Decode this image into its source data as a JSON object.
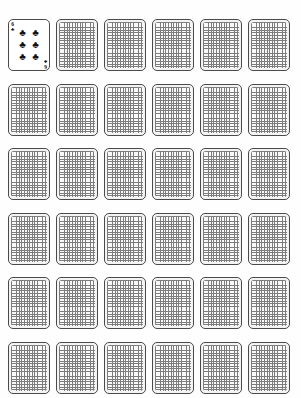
{
  "board": {
    "title": "Playing Card Grid",
    "columns": 6,
    "rows": 6,
    "total_cards": 36,
    "background_color": "#fefefe",
    "card_border_color": "#4a4a4a",
    "card_back_pattern": "fine-grid-checkered",
    "card_back_line_color": "#7d7d7d",
    "card_back_fill_color": "#fafafa"
  },
  "suits": {
    "clubs": {
      "glyph": "♣",
      "name": "clubs",
      "color": "#111111"
    },
    "spades": {
      "glyph": "♠",
      "name": "spades",
      "color": "#111111"
    },
    "hearts": {
      "glyph": "♥",
      "name": "hearts",
      "color": "#cc0000"
    },
    "diamonds": {
      "glyph": "♦",
      "name": "diamonds",
      "color": "#cc0000"
    }
  },
  "face_up_card": {
    "rank": "6",
    "suit": "clubs",
    "suit_glyph": "♣",
    "suit_color": "#111111",
    "label": "Six of Clubs",
    "pip_count": 6,
    "pips": [
      "♣",
      "♣",
      "♣",
      "♣",
      "♣",
      "♣"
    ]
  },
  "cards": [
    {
      "index": 0,
      "row": 0,
      "col": 0,
      "state": "face-up",
      "name": "card-six-of-clubs"
    },
    {
      "index": 1,
      "row": 0,
      "col": 1,
      "state": "face-down",
      "name": "card-back"
    },
    {
      "index": 2,
      "row": 0,
      "col": 2,
      "state": "face-down",
      "name": "card-back"
    },
    {
      "index": 3,
      "row": 0,
      "col": 3,
      "state": "face-down",
      "name": "card-back"
    },
    {
      "index": 4,
      "row": 0,
      "col": 4,
      "state": "face-down",
      "name": "card-back"
    },
    {
      "index": 5,
      "row": 0,
      "col": 5,
      "state": "face-down",
      "name": "card-back"
    },
    {
      "index": 6,
      "row": 1,
      "col": 0,
      "state": "face-down",
      "name": "card-back"
    },
    {
      "index": 7,
      "row": 1,
      "col": 1,
      "state": "face-down",
      "name": "card-back"
    },
    {
      "index": 8,
      "row": 1,
      "col": 2,
      "state": "face-down",
      "name": "card-back"
    },
    {
      "index": 9,
      "row": 1,
      "col": 3,
      "state": "face-down",
      "name": "card-back"
    },
    {
      "index": 10,
      "row": 1,
      "col": 4,
      "state": "face-down",
      "name": "card-back"
    },
    {
      "index": 11,
      "row": 1,
      "col": 5,
      "state": "face-down",
      "name": "card-back"
    },
    {
      "index": 12,
      "row": 2,
      "col": 0,
      "state": "face-down",
      "name": "card-back"
    },
    {
      "index": 13,
      "row": 2,
      "col": 1,
      "state": "face-down",
      "name": "card-back"
    },
    {
      "index": 14,
      "row": 2,
      "col": 2,
      "state": "face-down",
      "name": "card-back"
    },
    {
      "index": 15,
      "row": 2,
      "col": 3,
      "state": "face-down",
      "name": "card-back"
    },
    {
      "index": 16,
      "row": 2,
      "col": 4,
      "state": "face-down",
      "name": "card-back"
    },
    {
      "index": 17,
      "row": 2,
      "col": 5,
      "state": "face-down",
      "name": "card-back"
    },
    {
      "index": 18,
      "row": 3,
      "col": 0,
      "state": "face-down",
      "name": "card-back"
    },
    {
      "index": 19,
      "row": 3,
      "col": 1,
      "state": "face-down",
      "name": "card-back"
    },
    {
      "index": 20,
      "row": 3,
      "col": 2,
      "state": "face-down",
      "name": "card-back"
    },
    {
      "index": 21,
      "row": 3,
      "col": 3,
      "state": "face-down",
      "name": "card-back"
    },
    {
      "index": 22,
      "row": 3,
      "col": 4,
      "state": "face-down",
      "name": "card-back"
    },
    {
      "index": 23,
      "row": 3,
      "col": 5,
      "state": "face-down",
      "name": "card-back"
    },
    {
      "index": 24,
      "row": 4,
      "col": 0,
      "state": "face-down",
      "name": "card-back"
    },
    {
      "index": 25,
      "row": 4,
      "col": 1,
      "state": "face-down",
      "name": "card-back"
    },
    {
      "index": 26,
      "row": 4,
      "col": 2,
      "state": "face-down",
      "name": "card-back"
    },
    {
      "index": 27,
      "row": 4,
      "col": 3,
      "state": "face-down",
      "name": "card-back"
    },
    {
      "index": 28,
      "row": 4,
      "col": 4,
      "state": "face-down",
      "name": "card-back"
    },
    {
      "index": 29,
      "row": 4,
      "col": 5,
      "state": "face-down",
      "name": "card-back"
    },
    {
      "index": 30,
      "row": 5,
      "col": 0,
      "state": "face-down",
      "name": "card-back"
    },
    {
      "index": 31,
      "row": 5,
      "col": 1,
      "state": "face-down",
      "name": "card-back"
    },
    {
      "index": 32,
      "row": 5,
      "col": 2,
      "state": "face-down",
      "name": "card-back"
    },
    {
      "index": 33,
      "row": 5,
      "col": 3,
      "state": "face-down",
      "name": "card-back"
    },
    {
      "index": 34,
      "row": 5,
      "col": 4,
      "state": "face-down",
      "name": "card-back"
    },
    {
      "index": 35,
      "row": 5,
      "col": 5,
      "state": "face-down",
      "name": "card-back"
    }
  ],
  "layout": {
    "origin_x": 8,
    "origin_y": 19,
    "pitch_x": 48,
    "pitch_y": 64.5,
    "card_width": 42,
    "card_height": 52
  }
}
